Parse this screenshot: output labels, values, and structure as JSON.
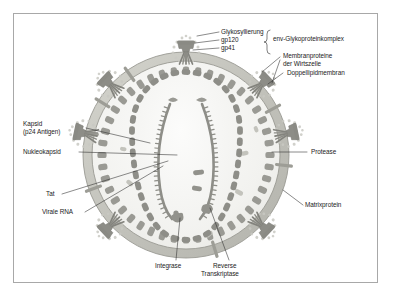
{
  "figure": {
    "language": "de",
    "background_color": "#ffffff",
    "frame_color": "#a8a8a8",
    "colors": {
      "membrane_band": "#c9c9c2",
      "membrane_band_edge": "#9a9a93",
      "protein_block": "#9a9a94",
      "capsid_block": "#8e8e88",
      "spike_knob": "#8a8a84",
      "rna_strand": "#8e8e88",
      "glyco_dot": "#c4c4be",
      "interior": "#f4f4f1",
      "leader_line": "#2b2b2b",
      "text": "#1b1b1b"
    }
  },
  "labels": {
    "glykosylierung": "Glykosyllierung",
    "gp120": "gp120",
    "gp41": "gp41",
    "env_complex": "env-Glykoproteinkomplex",
    "membranproteine_line1": "Membranproteine",
    "membranproteine_line2": "der Wirtszelle",
    "doppellipidmembran": "Doppellipidmembran",
    "kapsid_line1": "Kapsid",
    "kapsid_line2": "(p24 Antigen)",
    "nukleokapsid": "Nukleokapsid",
    "tat": "Tat",
    "virale_rna": "Virale RNA",
    "protease": "Protease",
    "matrixprotein": "Matrixprotein",
    "integrase": "Integrase",
    "reverse_line1": "Reverse",
    "reverse_line2": "Transkriptase"
  },
  "structure": {
    "envelope": {
      "name": "Doppellipidmembran",
      "shape": "circle",
      "center": [
        186,
        155
      ],
      "outer_radius": 103,
      "inner_radius": 93
    },
    "matrix_layer": {
      "name": "Matrixprotein",
      "block_count": 44,
      "radius": 84
    },
    "capsid": {
      "name": "Kapsid (p24 Antigen)",
      "shape": "oval-cone",
      "block_count": 40
    },
    "rna_strands": {
      "name": "Virale RNA",
      "count": 2,
      "with_nucleocapsid_teeth": true
    },
    "env_spikes": {
      "name": "env-Glykoproteinkomplex (gp120/gp41)",
      "count": 7,
      "angles_deg": [
        270,
        315,
        340,
        20,
        45,
        135,
        210
      ]
    },
    "host_membrane_proteins": {
      "name": "Membranproteine der Wirtszelle",
      "count": 6
    }
  }
}
